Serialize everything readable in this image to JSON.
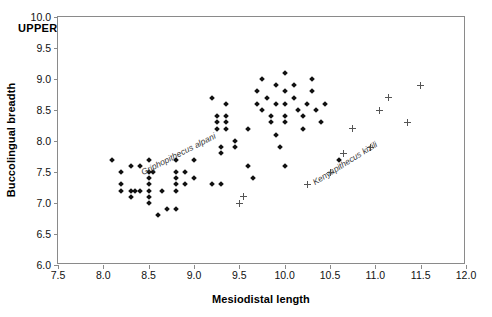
{
  "figure": {
    "panel_title": "UPPER I1",
    "background_color": "#ffffff"
  },
  "axes": {
    "x_title": "Mesiodistal length",
    "y_title": "Buccolingual breadth",
    "x_ticks": [
      "7.5",
      "8.0",
      "8.5",
      "9.0",
      "9.5",
      "10.0",
      "10.5",
      "11.0",
      "11.5",
      "12.0"
    ],
    "y_ticks": [
      "6.0",
      "6.5",
      "7.0",
      "7.5",
      "8.0",
      "8.5",
      "9.0",
      "9.5",
      "10.0"
    ]
  },
  "annotations": [
    {
      "name": "griphopithecus-alpani",
      "text": "Griphopithecus alpani"
    },
    {
      "name": "kenyapithecus-kizili",
      "text": "Kenyapithecus kizili"
    }
  ],
  "chart_data": {
    "type": "scatter",
    "title": "UPPER I1",
    "xlabel": "Mesiodistal length",
    "ylabel": "Buccolingual breadth",
    "xlim": [
      7.5,
      12.0
    ],
    "ylim": [
      6.0,
      10.0
    ],
    "xtick_step": 0.5,
    "ytick_step": 0.5,
    "grid": false,
    "legend": "none",
    "annotations": [
      {
        "text": "Griphopithecus alpani",
        "x": 8.9,
        "y": 7.85,
        "rotation_deg": -27,
        "style": "italic"
      },
      {
        "text": "Kenyapithecus kizili",
        "x": 10.55,
        "y": 7.6,
        "rotation_deg": -32,
        "style": "italic"
      }
    ],
    "series": [
      {
        "name": "Griphopithecus alpani",
        "marker": "filled-diamond",
        "color": "#111111",
        "points": [
          [
            8.1,
            7.7
          ],
          [
            8.2,
            7.5
          ],
          [
            8.2,
            7.3
          ],
          [
            8.2,
            7.2
          ],
          [
            8.3,
            7.6
          ],
          [
            8.3,
            7.2
          ],
          [
            8.3,
            7.1
          ],
          [
            8.35,
            7.2
          ],
          [
            8.4,
            7.6
          ],
          [
            8.4,
            7.2
          ],
          [
            8.5,
            7.7
          ],
          [
            8.5,
            7.5
          ],
          [
            8.5,
            7.4
          ],
          [
            8.5,
            7.3
          ],
          [
            8.5,
            7.2
          ],
          [
            8.5,
            7.1
          ],
          [
            8.5,
            7.0
          ],
          [
            8.55,
            7.5
          ],
          [
            8.6,
            6.8
          ],
          [
            8.65,
            7.2
          ],
          [
            8.7,
            6.9
          ],
          [
            8.8,
            7.7
          ],
          [
            8.8,
            7.5
          ],
          [
            8.8,
            7.4
          ],
          [
            8.8,
            7.3
          ],
          [
            8.8,
            7.2
          ],
          [
            8.8,
            6.9
          ],
          [
            8.9,
            7.5
          ],
          [
            8.9,
            7.3
          ],
          [
            9.0,
            7.7
          ],
          [
            9.0,
            7.4
          ],
          [
            9.2,
            7.3
          ],
          [
            9.3,
            7.3
          ],
          [
            9.2,
            8.7
          ],
          [
            9.25,
            8.4
          ],
          [
            9.25,
            8.3
          ],
          [
            9.25,
            8.2
          ],
          [
            9.35,
            8.6
          ],
          [
            9.35,
            8.4
          ],
          [
            9.35,
            8.3
          ],
          [
            9.35,
            8.2
          ],
          [
            9.3,
            7.9
          ],
          [
            9.3,
            7.8
          ],
          [
            9.45,
            8.0
          ],
          [
            9.45,
            7.9
          ],
          [
            9.6,
            8.2
          ],
          [
            9.6,
            7.6
          ],
          [
            9.65,
            7.4
          ],
          [
            9.7,
            8.8
          ],
          [
            9.7,
            8.6
          ],
          [
            9.75,
            9.0
          ],
          [
            9.75,
            8.5
          ],
          [
            9.8,
            8.7
          ],
          [
            9.85,
            8.4
          ],
          [
            9.85,
            8.3
          ],
          [
            9.9,
            8.9
          ],
          [
            9.9,
            8.6
          ],
          [
            9.9,
            8.1
          ],
          [
            9.95,
            7.9
          ],
          [
            10.0,
            9.1
          ],
          [
            10.0,
            8.8
          ],
          [
            10.0,
            8.6
          ],
          [
            10.0,
            8.4
          ],
          [
            10.0,
            8.3
          ],
          [
            10.0,
            7.6
          ],
          [
            10.1,
            8.9
          ],
          [
            10.1,
            8.7
          ],
          [
            10.15,
            8.5
          ],
          [
            10.2,
            8.4
          ],
          [
            10.2,
            8.2
          ],
          [
            10.25,
            8.6
          ],
          [
            10.3,
            9.0
          ],
          [
            10.3,
            8.8
          ],
          [
            10.35,
            8.5
          ],
          [
            10.4,
            8.3
          ],
          [
            10.45,
            8.6
          ],
          [
            10.6,
            7.7
          ]
        ]
      },
      {
        "name": "Kenyapithecus kizili",
        "marker": "plus",
        "color": "#555555",
        "points": [
          [
            9.5,
            7.0
          ],
          [
            9.55,
            7.1
          ],
          [
            10.25,
            7.3
          ],
          [
            10.5,
            7.5
          ],
          [
            10.65,
            7.8
          ],
          [
            10.75,
            8.2
          ],
          [
            10.95,
            7.9
          ],
          [
            11.05,
            8.5
          ],
          [
            11.15,
            8.7
          ],
          [
            11.35,
            8.3
          ],
          [
            11.5,
            8.9
          ]
        ]
      }
    ]
  }
}
